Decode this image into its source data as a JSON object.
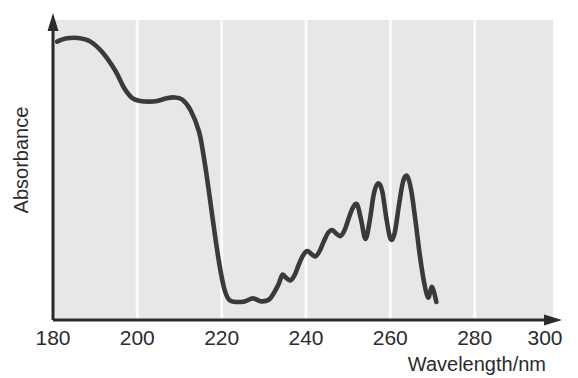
{
  "figure": {
    "kind": "uv-vis-absorbance-spectrum",
    "background_color": "#ffffff",
    "plot_background_color": "#e7e7e7",
    "curve_color": "#3a3a3a",
    "axis_color": "#2b2b2b",
    "gridline_color": "#fbfbfb"
  },
  "axes": {
    "y_label": "Absorbance",
    "x_label": "Wavelength/nm",
    "x_ticks": [
      "180",
      "200",
      "220",
      "240",
      "260",
      "280",
      "300"
    ]
  },
  "chart_data": {
    "type": "line",
    "title": "",
    "subtitle": "",
    "xlabel": "Wavelength/nm",
    "ylabel": "Absorbance",
    "xlim": [
      180,
      300
    ],
    "ylim": [
      0,
      1
    ],
    "xticks": [
      180,
      200,
      220,
      240,
      260,
      280,
      300
    ],
    "yticks": [],
    "grid": "vertical-only",
    "legend": "none",
    "annotations": [],
    "series": [
      {
        "name": "Absorbance spectrum",
        "color": "#3a3a3a",
        "x": [
          181,
          183,
          186,
          189,
          192,
          195,
          197,
          199,
          201,
          203,
          205,
          207,
          209,
          211,
          213,
          215,
          216,
          217,
          218,
          219,
          220,
          221,
          222,
          223,
          224,
          226,
          228,
          230,
          232,
          234,
          235,
          236,
          237,
          238,
          239,
          240,
          241,
          242,
          243,
          244,
          245,
          246,
          247,
          248,
          249,
          250,
          251,
          252,
          253,
          254,
          255,
          256,
          257,
          258,
          259,
          260,
          261,
          262,
          263,
          264,
          265,
          266,
          267,
          268,
          269,
          270,
          271,
          272
        ],
        "y": [
          0.928,
          0.938,
          0.94,
          0.928,
          0.89,
          0.83,
          0.775,
          0.74,
          0.73,
          0.728,
          0.73,
          0.738,
          0.742,
          0.735,
          0.7,
          0.63,
          0.56,
          0.47,
          0.37,
          0.27,
          0.18,
          0.11,
          0.072,
          0.062,
          0.06,
          0.062,
          0.072,
          0.062,
          0.07,
          0.115,
          0.15,
          0.14,
          0.132,
          0.15,
          0.185,
          0.215,
          0.23,
          0.22,
          0.212,
          0.23,
          0.262,
          0.29,
          0.3,
          0.288,
          0.28,
          0.3,
          0.34,
          0.375,
          0.385,
          0.33,
          0.27,
          0.33,
          0.42,
          0.455,
          0.43,
          0.34,
          0.27,
          0.29,
          0.38,
          0.46,
          0.48,
          0.43,
          0.33,
          0.22,
          0.13,
          0.075,
          0.11,
          0.06
        ]
      }
    ]
  }
}
